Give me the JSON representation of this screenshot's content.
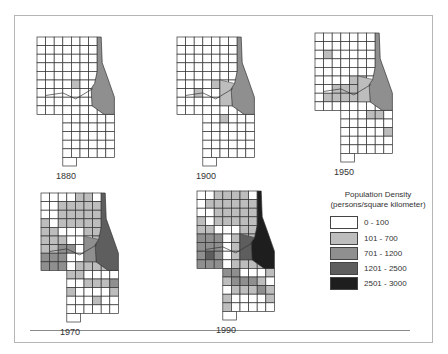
{
  "figure": {
    "maps": [
      {
        "year": "1880",
        "x": 36,
        "y": 36,
        "cells": "0000000000000000000000000000000000000001000000000000000000000000000000000000000000000000000000000000000000000000000000000000",
        "core": 2,
        "ring": 0
      },
      {
        "year": "1900",
        "x": 176,
        "y": 36,
        "cells": "0000000000000000000000000000000000000001000001000000000000000000000001000000000000000000000000000000000000000000000000000000",
        "core": 2,
        "ring": 1
      },
      {
        "year": "1950",
        "x": 314,
        "y": 32,
        "cells": "0000000000000001000000000000000000000001100001110000111100000000000000110000000000001000000000000000000000000000000000000000",
        "core": 2,
        "ring": 1
      },
      {
        "year": "1970",
        "x": 40,
        "y": 192,
        "cells": "0000110001111100111111011111110001111100011112201112220011122201111110000001112100001000100000000000000000000000000000000000",
        "core": 3,
        "ring": 2
      },
      {
        "year": "1990",
        "x": 196,
        "y": 190,
        "cells": "0011110011111100111111011111110001122201112222011222320112222201111220001122210011121100001100000000000000000000000000000000",
        "core": 4,
        "ring": 3
      }
    ]
  },
  "legend": {
    "title_line1": "Population Density",
    "title_line2": "(persons/square kilometer)",
    "items": [
      {
        "label": "0 - 100",
        "color": "#ffffff"
      },
      {
        "label": "101 - 700",
        "color": "#bdbdbd"
      },
      {
        "label": "701 - 1200",
        "color": "#8f8f8f"
      },
      {
        "label": "1201 - 2500",
        "color": "#5e5e5e"
      },
      {
        "label": "2501 - 3000",
        "color": "#1e1e1e"
      }
    ]
  },
  "chart_data": {
    "type": "choropleth",
    "title": "",
    "legend_title": "Population Density (persons/square kilometer)",
    "classes": [
      "0 - 100",
      "101 - 700",
      "701 - 1200",
      "1201 - 2500",
      "2501 - 3000"
    ],
    "panels": [
      "1880",
      "1900",
      "1950",
      "1970",
      "1990"
    ],
    "panel_core_class": {
      "1880": "701 - 1200",
      "1900": "701 - 1200",
      "1950": "701 - 1200",
      "1970": "1201 - 2500",
      "1990": "2501 - 3000"
    }
  }
}
